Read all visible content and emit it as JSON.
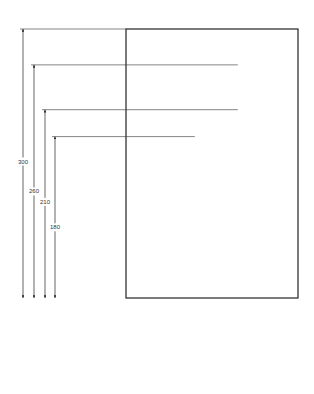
{
  "drawing": {
    "title": "Hole position drawing",
    "plate": {
      "width_units": 200,
      "height_units": 300
    },
    "holes": [
      {
        "x": 130,
        "y": 260,
        "size": "large"
      },
      {
        "x": 130,
        "y": 210,
        "size": "small"
      },
      {
        "x": 80,
        "y": 180,
        "size": "large"
      },
      {
        "x": 35,
        "y": 150,
        "size": "medium"
      },
      {
        "x": 80,
        "y": 100,
        "size": "large"
      },
      {
        "x": 140,
        "y": 80,
        "size": "tiny"
      },
      {
        "x": 35,
        "y": 40,
        "size": "large"
      },
      {
        "x": 100,
        "y": 40,
        "size": "tiny"
      },
      {
        "x": 140,
        "y": 40,
        "size": "tiny"
      }
    ],
    "vertical_dims": [
      "300",
      "260",
      "210",
      "180",
      "140",
      "100",
      "80",
      "40"
    ],
    "horizontal_dims": [
      "35",
      "80",
      "100",
      "130",
      "140",
      "200"
    ]
  }
}
